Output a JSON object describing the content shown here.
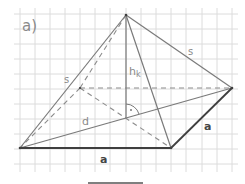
{
  "figure": {
    "part_label": "a)",
    "labels": {
      "slant_edge_left": "s",
      "slant_edge_right": "s",
      "height": "h",
      "height_subscript": "k",
      "diagonal": "d",
      "base_edge_front": "a",
      "base_edge_right": "a",
      "right_angle_mark": "·"
    },
    "colors": {
      "grid": "#d9d9d9",
      "edges": "#7a7a7a",
      "base_edges": "#3f3f3f",
      "hidden": "#8c8c8c",
      "text": "#8a8a8a",
      "bold_text": "#444444"
    },
    "vertices": {
      "apex": [
        126,
        15
      ],
      "back_left": [
        80,
        88
      ],
      "back_right": [
        232,
        88
      ],
      "front_left": [
        20,
        148
      ],
      "front_right": [
        171,
        148
      ],
      "height_foot": [
        126,
        118
      ]
    },
    "grid": {
      "x0": 20,
      "y0": 14,
      "step": 15.2,
      "cols": 15,
      "rows": 11
    }
  }
}
